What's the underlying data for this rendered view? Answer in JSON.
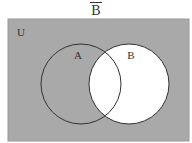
{
  "title": "B",
  "title_overline": true,
  "universe_label": "U",
  "sets": [
    {
      "label": "A",
      "cx": 81,
      "cy": 84,
      "r": 40
    },
    {
      "label": "B",
      "cx": 129,
      "cy": 84,
      "r": 40
    }
  ],
  "shaded_region": "complement of B",
  "colors": {
    "shade": "#a9a9a9",
    "unshaded": "#ffffff",
    "stroke": "#333333"
  }
}
